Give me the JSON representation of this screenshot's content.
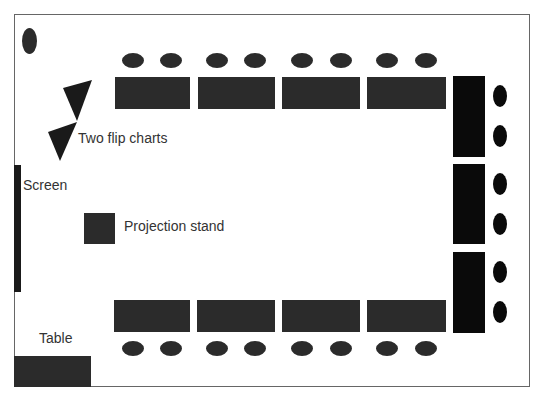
{
  "labels": {
    "flip_charts": "Two flip charts",
    "screen": "Screen",
    "projection_stand": "Projection stand",
    "table": "Table"
  },
  "layout": {
    "top_tables": 4,
    "bottom_tables": 4,
    "right_tables": 3,
    "chairs_per_table": 2
  },
  "colors": {
    "furniture": "#2b2b2b",
    "right_furniture": "#0a0a0a",
    "border": "#666666"
  }
}
